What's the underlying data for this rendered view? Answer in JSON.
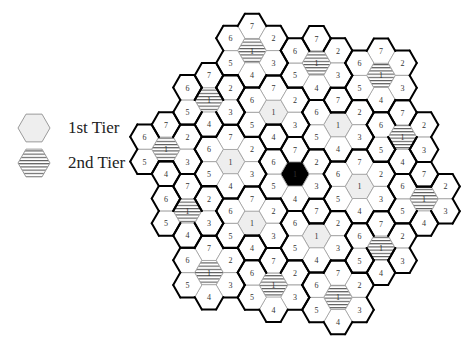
{
  "legend": {
    "items": [
      {
        "key": "tier1",
        "label": "1st Tier",
        "cx": 34,
        "cy": 128,
        "label_x": 68,
        "label_y": 118
      },
      {
        "key": "tier2",
        "label": "2nd Tier",
        "cx": 34,
        "cy": 163,
        "label_x": 68,
        "label_y": 153
      }
    ]
  },
  "colors": {
    "hex_stroke": "#9a9a9a",
    "cluster_stroke": "#000000",
    "reference_fill": "#000000",
    "tier1_fill": "#eeeeee",
    "tier2_stripe": "#555555",
    "background": "#ffffff"
  },
  "geometry": {
    "center": [
      295,
      174
    ],
    "hex_radius": 14.3,
    "vec_up": [
      0,
      -24.5
    ],
    "vec_ur": [
      21.5,
      -12.4
    ],
    "vec_dr": [
      21.5,
      12.4
    ]
  },
  "cluster_pattern": {
    "description": "7-cell reuse cluster",
    "cells": [
      {
        "pos": "center",
        "label": "1"
      },
      {
        "pos": "up",
        "label": "7"
      },
      {
        "pos": "ur",
        "label": "2"
      },
      {
        "pos": "dr",
        "label": "3"
      },
      {
        "pos": "down",
        "label": "4"
      },
      {
        "pos": "dl",
        "label": "5"
      },
      {
        "pos": "ul",
        "label": "6"
      }
    ]
  },
  "clusters": [
    {
      "name": "reference",
      "tier": 0,
      "a": 0,
      "b": 0
    },
    {
      "name": "t1-a",
      "tier": 1,
      "a": 1,
      "b": 0
    },
    {
      "name": "t1-b",
      "tier": 1,
      "a": 0,
      "b": 1
    },
    {
      "name": "t1-c",
      "tier": 1,
      "a": -1,
      "b": 1
    },
    {
      "name": "t1-d",
      "tier": 1,
      "a": -1,
      "b": 0
    },
    {
      "name": "t1-e",
      "tier": 1,
      "a": 0,
      "b": -1
    },
    {
      "name": "t1-f",
      "tier": 1,
      "a": 1,
      "b": -1
    },
    {
      "name": "t2-1",
      "tier": 2,
      "a": 2,
      "b": 0
    },
    {
      "name": "t2-2",
      "tier": 2,
      "a": 1,
      "b": 1
    },
    {
      "name": "t2-3",
      "tier": 2,
      "a": 0,
      "b": 2
    },
    {
      "name": "t2-4",
      "tier": 2,
      "a": -1,
      "b": 2
    },
    {
      "name": "t2-5",
      "tier": 2,
      "a": -2,
      "b": 2
    },
    {
      "name": "t2-6",
      "tier": 2,
      "a": -2,
      "b": 1
    },
    {
      "name": "t2-7",
      "tier": 2,
      "a": -2,
      "b": 0
    },
    {
      "name": "t2-8",
      "tier": 2,
      "a": -1,
      "b": -1
    },
    {
      "name": "t2-9",
      "tier": 2,
      "a": 0,
      "b": -2
    },
    {
      "name": "t2-10",
      "tier": 2,
      "a": 1,
      "b": -2
    },
    {
      "name": "t2-11",
      "tier": 2,
      "a": 2,
      "b": -2
    },
    {
      "name": "t2-12",
      "tier": 2,
      "a": 2,
      "b": -1
    }
  ]
}
